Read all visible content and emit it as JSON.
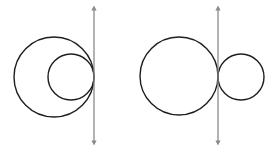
{
  "diagram": {
    "colors": {
      "background": "#ffffff",
      "circle_stroke": "#1e1e1e",
      "line_stroke": "#8a8a8a"
    },
    "figures": [
      {
        "name": "internally-tangent",
        "line": {
          "x": 94,
          "y1": 8,
          "y2": 143
        },
        "circles": [
          {
            "cx": 54,
            "cy": 77,
            "r": 40
          },
          {
            "cx": 71,
            "cy": 77,
            "r": 23
          }
        ]
      },
      {
        "name": "externally-tangent",
        "line": {
          "x": 218,
          "y1": 8,
          "y2": 143
        },
        "circles": [
          {
            "cx": 179,
            "cy": 76,
            "r": 39
          },
          {
            "cx": 241,
            "cy": 77,
            "r": 23
          }
        ]
      }
    ]
  }
}
